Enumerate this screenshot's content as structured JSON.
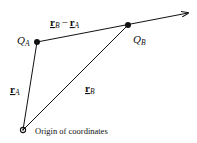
{
  "diagram": {
    "points": {
      "q_a": {
        "label": "Q",
        "subscript": "A"
      },
      "q_b": {
        "label": "Q",
        "subscript": "B"
      },
      "origin": {
        "label": "Origin of coordinates"
      }
    },
    "vectors": {
      "r_a": {
        "symbol": "r",
        "subscript": "A"
      },
      "r_b": {
        "symbol": "r",
        "subscript": "B"
      },
      "r_diff": {
        "symbol_1": "r",
        "subscript_1": "B",
        "operator": "−",
        "symbol_2": "r",
        "subscript_2": "A"
      }
    },
    "colors": {
      "ink": "#111111",
      "background": "#ffffff"
    }
  }
}
